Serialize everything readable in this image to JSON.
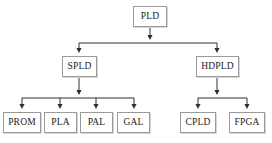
{
  "diagram": {
    "background_color": "#ffffff",
    "box_border_color": "#9a9a9a",
    "box_fill_color": "#ffffff",
    "line_color": "#3a3a3a",
    "text_color": "#1a1a1a",
    "nodes": [
      {
        "id": "pld",
        "label": "PLD",
        "x": 133,
        "y": 6,
        "w": 34,
        "h": 21,
        "level": 0
      },
      {
        "id": "spld",
        "label": "SPLD",
        "x": 62,
        "y": 56,
        "w": 35,
        "h": 21,
        "level": 1
      },
      {
        "id": "hdpld",
        "label": "HDPLD",
        "x": 196,
        "y": 56,
        "w": 43,
        "h": 21,
        "level": 1
      },
      {
        "id": "prom",
        "label": "PROM",
        "x": 3,
        "y": 112,
        "w": 38,
        "h": 21,
        "level": 2
      },
      {
        "id": "pla",
        "label": "PLA",
        "x": 44,
        "y": 112,
        "w": 33,
        "h": 21,
        "level": 2
      },
      {
        "id": "pal",
        "label": "PAL",
        "x": 80,
        "y": 112,
        "w": 33,
        "h": 21,
        "level": 2
      },
      {
        "id": "gal",
        "label": "GAL",
        "x": 117,
        "y": 112,
        "w": 33,
        "h": 21,
        "level": 2
      },
      {
        "id": "cpld",
        "label": "CPLD",
        "x": 180,
        "y": 112,
        "w": 36,
        "h": 21,
        "level": 2
      },
      {
        "id": "fpga",
        "label": "FPGA",
        "x": 229,
        "y": 112,
        "w": 36,
        "h": 21,
        "level": 2
      }
    ],
    "edges": [
      {
        "id": "pld-bus",
        "from": "pld",
        "to": [
          "spld",
          "hdpld"
        ],
        "bus_y": 43
      },
      {
        "id": "spld-bus",
        "from": "spld",
        "to": [
          "prom",
          "pla",
          "pal",
          "gal"
        ],
        "bus_y": 98
      },
      {
        "id": "hdpld-bus",
        "from": "hdpld",
        "to": [
          "cpld",
          "fpga"
        ],
        "bus_y": 98
      }
    ]
  }
}
